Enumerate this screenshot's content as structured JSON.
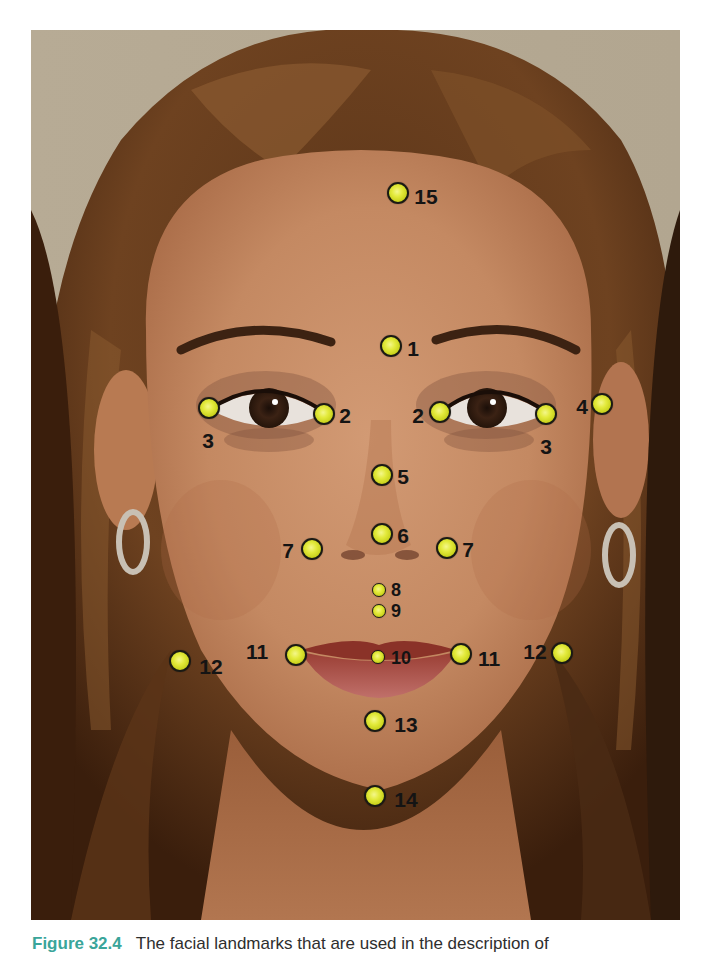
{
  "figure": {
    "caption_label": "Figure 32.4",
    "caption_text": "The facial landmarks that are used in the description of",
    "colors": {
      "marker_fill": "#e3ea3c",
      "marker_outline": "#1a1a14",
      "label_text": "#141414",
      "caption_label": "#3aa59a",
      "caption_text": "#2e2e2e",
      "photo_background": "#b3a792"
    },
    "landmarks": [
      {
        "id": "15",
        "label": "15",
        "marker": [
          398,
          193
        ],
        "size": "big",
        "label_pos": [
          426,
          196
        ]
      },
      {
        "id": "1",
        "label": "1",
        "marker": [
          391,
          346
        ],
        "size": "big",
        "label_pos": [
          413,
          348
        ]
      },
      {
        "id": "3-left",
        "label": "3",
        "marker": [
          209,
          408
        ],
        "size": "big",
        "label_pos": [
          208,
          440
        ]
      },
      {
        "id": "2-left",
        "label": "2",
        "marker": [
          324,
          414
        ],
        "size": "big",
        "label_pos": [
          345,
          415
        ]
      },
      {
        "id": "2-right",
        "label": "2",
        "marker": [
          440,
          412
        ],
        "size": "big",
        "label_pos": [
          418,
          415
        ]
      },
      {
        "id": "3-right",
        "label": "3",
        "marker": [
          546,
          414
        ],
        "size": "big",
        "label_pos": [
          546,
          446
        ]
      },
      {
        "id": "4",
        "label": "4",
        "marker": [
          602,
          404
        ],
        "size": "big",
        "label_pos": [
          582,
          406
        ]
      },
      {
        "id": "5",
        "label": "5",
        "marker": [
          382,
          475
        ],
        "size": "big",
        "label_pos": [
          403,
          476
        ]
      },
      {
        "id": "6",
        "label": "6",
        "marker": [
          382,
          534
        ],
        "size": "big",
        "label_pos": [
          403,
          535
        ]
      },
      {
        "id": "7-left",
        "label": "7",
        "marker": [
          312,
          549
        ],
        "size": "big",
        "label_pos": [
          288,
          550
        ]
      },
      {
        "id": "7-right",
        "label": "7",
        "marker": [
          447,
          548
        ],
        "size": "big",
        "label_pos": [
          468,
          549
        ]
      },
      {
        "id": "8",
        "label": "8",
        "marker": [
          379,
          590
        ],
        "size": "small",
        "label_pos": [
          396,
          590
        ]
      },
      {
        "id": "9",
        "label": "9",
        "marker": [
          379,
          611
        ],
        "size": "small",
        "label_pos": [
          396,
          611
        ]
      },
      {
        "id": "12-left",
        "label": "12",
        "marker": [
          180,
          661
        ],
        "size": "big",
        "label_pos": [
          211,
          666
        ]
      },
      {
        "id": "11-left",
        "label": "11",
        "marker": [
          296,
          655
        ],
        "size": "big",
        "label_pos": [
          257,
          651
        ]
      },
      {
        "id": "10",
        "label": "10",
        "marker": [
          378,
          657
        ],
        "size": "small",
        "label_pos": [
          401,
          658
        ]
      },
      {
        "id": "11-right",
        "label": "11",
        "marker": [
          461,
          654
        ],
        "size": "big",
        "label_pos": [
          489,
          658
        ]
      },
      {
        "id": "12-right",
        "label": "12",
        "marker": [
          562,
          653
        ],
        "size": "big",
        "label_pos": [
          535,
          651
        ]
      },
      {
        "id": "13",
        "label": "13",
        "marker": [
          375,
          721
        ],
        "size": "big",
        "label_pos": [
          406,
          724
        ]
      },
      {
        "id": "14",
        "label": "14",
        "marker": [
          375,
          796
        ],
        "size": "big",
        "label_pos": [
          406,
          799
        ]
      }
    ]
  }
}
